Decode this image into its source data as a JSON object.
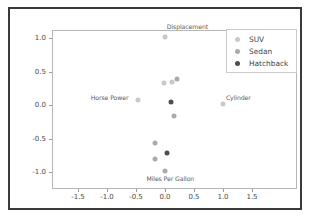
{
  "chart_data": {
    "type": "scatter",
    "title": "",
    "xlabel": "",
    "ylabel": "",
    "xlim": [
      -1.75,
      1.75
    ],
    "ylim": [
      -1.18,
      1.18
    ],
    "grid": false,
    "legend_position": "upper right",
    "xticks": [
      "-1.5",
      "-1.0",
      "-0.5",
      "0.0",
      "0.5",
      "1.0",
      "1.5"
    ],
    "xtick_values": [
      -1.5,
      -1.0,
      -0.5,
      0.0,
      0.5,
      1.0,
      1.5
    ],
    "yticks": [
      "1.0",
      "0.5",
      "0.0",
      "-0.5",
      "-1.0"
    ],
    "ytick_values": [
      1.0,
      0.5,
      0.0,
      -0.5,
      -1.0
    ],
    "series": [
      {
        "name": "SUV",
        "color": "#c9c9c9",
        "points": [
          {
            "x": 0.0,
            "y": 1.01
          },
          {
            "x": -0.46,
            "y": 0.08
          },
          {
            "x": 1.0,
            "y": 0.01
          },
          {
            "x": -0.02,
            "y": 0.33
          },
          {
            "x": 0.12,
            "y": 0.34
          }
        ]
      },
      {
        "name": "Sedan",
        "color": "#aaaaaa",
        "points": [
          {
            "x": 0.21,
            "y": 0.39
          },
          {
            "x": 0.15,
            "y": -0.17
          },
          {
            "x": -0.17,
            "y": -0.57
          },
          {
            "x": -0.18,
            "y": -0.81
          },
          {
            "x": 0.0,
            "y": -0.98
          }
        ]
      },
      {
        "name": "Hatchback",
        "color": "#4d4d4d",
        "points": [
          {
            "x": 0.1,
            "y": 0.05
          },
          {
            "x": 0.03,
            "y": -0.72
          }
        ]
      }
    ],
    "annotations": [
      {
        "text": "Displacement",
        "x": 0.03,
        "y": 1.17
      },
      {
        "text": "Horse Power",
        "x": -1.28,
        "y": 0.11
      },
      {
        "text": "Cylinder",
        "x": 1.05,
        "y": 0.11
      },
      {
        "text": "Miles Per Gallon",
        "x": -0.32,
        "y": -1.1
      }
    ]
  },
  "legend": {
    "entries": [
      {
        "label": "SUV",
        "color": "#c9c9c9"
      },
      {
        "label": "Sedan",
        "color": "#aaaaaa"
      },
      {
        "label": "Hatchback",
        "color": "#4d4d4d"
      }
    ]
  }
}
